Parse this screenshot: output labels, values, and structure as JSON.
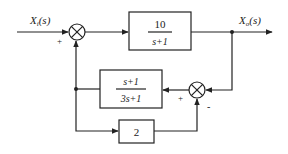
{
  "diagram": {
    "type": "block-diagram",
    "input_label": "X",
    "input_sub": "i",
    "input_arg": "(s)",
    "output_label": "X",
    "output_sub": "o",
    "output_arg": "(s)",
    "sum1": {
      "sign_input": "+"
    },
    "sum2": {
      "sign_left": "+",
      "sign_bottom": "-"
    },
    "blocks": [
      {
        "id": "forward",
        "numerator": "10",
        "denominator": "s+1"
      },
      {
        "id": "feedback",
        "numerator": "s+1",
        "denominator": "3s+1"
      },
      {
        "id": "gain",
        "value": "2"
      }
    ]
  }
}
